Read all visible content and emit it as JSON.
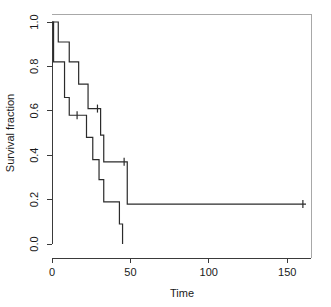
{
  "chart_data": {
    "type": "line",
    "title": "",
    "subtitle": "",
    "xlabel": "Time",
    "ylabel": "Survival fraction",
    "xlim": [
      0,
      165
    ],
    "ylim": [
      0.0,
      1.0
    ],
    "xticks": [
      0,
      50,
      100,
      150
    ],
    "xtick_labels": [
      "0",
      "50",
      "100",
      "150"
    ],
    "yticks": [
      0.0,
      0.2,
      0.4,
      0.6,
      0.8,
      1.0
    ],
    "ytick_labels": [
      "0.0",
      "0.2",
      "0.4",
      "0.6",
      "0.8",
      "1.0"
    ],
    "grid": false,
    "legend": false,
    "legend_position": "none",
    "plot_style": "kaplan-meier-step",
    "series": [
      {
        "name": "Group 1",
        "step_points": [
          [
            0,
            1.0
          ],
          [
            4,
            1.0
          ],
          [
            4,
            0.91
          ],
          [
            11,
            0.91
          ],
          [
            11,
            0.82
          ],
          [
            17,
            0.82
          ],
          [
            17,
            0.72
          ],
          [
            23,
            0.72
          ],
          [
            23,
            0.61
          ],
          [
            31,
            0.61
          ],
          [
            31,
            0.49
          ],
          [
            33,
            0.49
          ],
          [
            33,
            0.37
          ],
          [
            48,
            0.37
          ],
          [
            48,
            0.18
          ],
          [
            162,
            0.18
          ]
        ],
        "censor_times": [
          29,
          46,
          160
        ],
        "censor_values": [
          0.61,
          0.37,
          0.18
        ]
      },
      {
        "name": "Group 2",
        "step_points": [
          [
            0,
            1.0
          ],
          [
            1,
            1.0
          ],
          [
            1,
            0.82
          ],
          [
            8,
            0.82
          ],
          [
            8,
            0.66
          ],
          [
            11,
            0.66
          ],
          [
            11,
            0.58
          ],
          [
            22,
            0.58
          ],
          [
            22,
            0.48
          ],
          [
            26,
            0.48
          ],
          [
            26,
            0.38
          ],
          [
            30,
            0.38
          ],
          [
            30,
            0.29
          ],
          [
            33,
            0.29
          ],
          [
            33,
            0.19
          ],
          [
            43,
            0.19
          ],
          [
            43,
            0.09
          ],
          [
            45,
            0.09
          ],
          [
            45,
            0.0
          ]
        ],
        "censor_times": [
          16
        ],
        "censor_values": [
          0.58
        ]
      }
    ],
    "colors": {
      "curve": "#2b2b2b",
      "axis": "#3a3a3a",
      "box": "#a8a8a8",
      "background": "#ffffff",
      "text": "#1a1a1a"
    }
  }
}
